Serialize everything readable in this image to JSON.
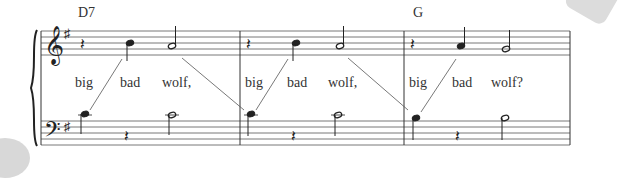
{
  "chords": [
    {
      "label": "D7",
      "x": 78,
      "y": 17
    },
    {
      "label": "G",
      "x": 413,
      "y": 17
    }
  ],
  "lyrics": [
    {
      "text": "big",
      "x": 75
    },
    {
      "text": "bad",
      "x": 120
    },
    {
      "text": "wolf,",
      "x": 162
    },
    {
      "text": "big",
      "x": 245
    },
    {
      "text": "bad",
      "x": 287
    },
    {
      "text": "wolf,",
      "x": 328
    },
    {
      "text": "big",
      "x": 409
    },
    {
      "text": "bad",
      "x": 452
    },
    {
      "text": "wolf?",
      "x": 491
    }
  ],
  "key_signature": "G major (1 sharp)",
  "measures": 3,
  "colors": {
    "ink": "#333333",
    "staff": "#555555",
    "curl": "#d8d8d8"
  }
}
